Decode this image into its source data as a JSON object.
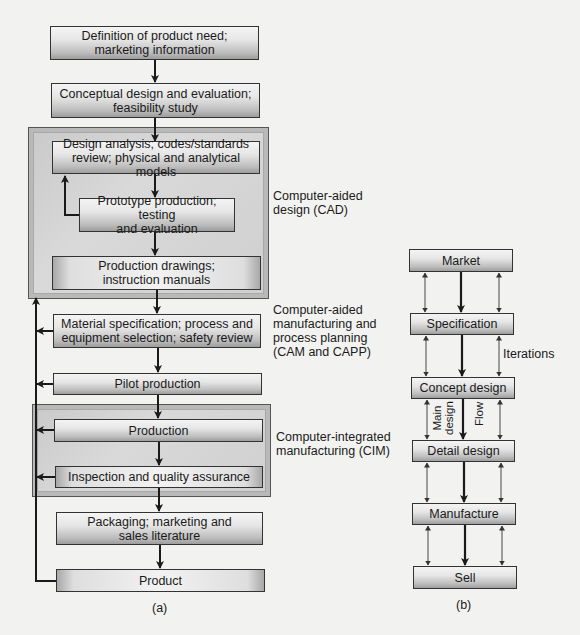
{
  "diagram_a": {
    "caption": "(a)",
    "boxes": [
      {
        "id": "product-need",
        "lines": [
          "Definition of product need;",
          "marketing information"
        ]
      },
      {
        "id": "conceptual-design",
        "lines": [
          "Conceptual design and evaluation;",
          "feasibility study"
        ]
      },
      {
        "id": "design-analysis",
        "lines": [
          "Design analysis; codes/standards",
          "review; physical and analytical models"
        ]
      },
      {
        "id": "prototype",
        "lines": [
          "Prototype production; testing",
          "and evaluation"
        ]
      },
      {
        "id": "production-drawings",
        "lines": [
          "Production drawings;",
          "instruction manuals"
        ]
      },
      {
        "id": "material-spec",
        "lines": [
          "Material specification; process and",
          "equipment selection; safety review"
        ]
      },
      {
        "id": "pilot-production",
        "lines": [
          "Pilot production"
        ]
      },
      {
        "id": "production",
        "lines": [
          "Production"
        ]
      },
      {
        "id": "inspection",
        "lines": [
          "Inspection and quality assurance"
        ]
      },
      {
        "id": "packaging",
        "lines": [
          "Packaging; marketing and",
          "sales literature"
        ]
      },
      {
        "id": "product",
        "lines": [
          "Product"
        ]
      }
    ],
    "group_labels": {
      "cad": [
        "Computer-aided",
        "design (CAD)"
      ],
      "cam": [
        "Computer-aided",
        "manufacturing and",
        "process planning",
        "(CAM and CAPP)"
      ],
      "cim": [
        "Computer-integrated",
        "manufacturing (CIM)"
      ]
    }
  },
  "diagram_b": {
    "caption": "(b)",
    "boxes": [
      "Market",
      "Specification",
      "Concept design",
      "Detail design",
      "Manufacture",
      "Sell"
    ],
    "labels": {
      "iterations": "Iterations",
      "main_design_1": "Main",
      "main_design_2": "design",
      "flow": "Flow"
    }
  },
  "colors": {
    "line": "#1a1a1a",
    "box_border": "#333333",
    "group_fill": "#d0d0d0",
    "background": "#f2f2f0"
  }
}
